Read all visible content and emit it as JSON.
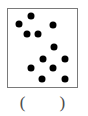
{
  "worksheet": {
    "box": {
      "border_color": "#7a7a7a",
      "background_color": "#ffffff",
      "x": 7,
      "y": 8,
      "width": 71,
      "height": 80
    },
    "dot_color": "#000000",
    "dot_diameter": 7,
    "dot_count": 12,
    "dots": [
      {
        "label": "dot-1",
        "x": 23,
        "y": 7
      },
      {
        "label": "dot-2",
        "x": 11,
        "y": 15
      },
      {
        "label": "dot-3",
        "x": 45,
        "y": 16
      },
      {
        "label": "dot-4",
        "x": 19,
        "y": 25
      },
      {
        "label": "dot-5",
        "x": 30,
        "y": 25
      },
      {
        "label": "dot-6",
        "x": 46,
        "y": 38
      },
      {
        "label": "dot-7",
        "x": 35,
        "y": 50
      },
      {
        "label": "dot-8",
        "x": 57,
        "y": 50
      },
      {
        "label": "dot-9",
        "x": 23,
        "y": 59
      },
      {
        "label": "dot-10",
        "x": 45,
        "y": 59
      },
      {
        "label": "dot-11",
        "x": 34,
        "y": 70
      },
      {
        "label": "dot-12",
        "x": 57,
        "y": 70
      }
    ],
    "answer": {
      "paren_open": "(",
      "paren_close": ")",
      "value": "",
      "placeholder": ""
    }
  }
}
